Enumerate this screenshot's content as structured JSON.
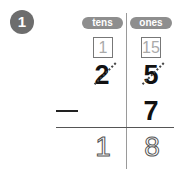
{
  "problem": {
    "number": "1",
    "columns": {
      "tens": "tens",
      "ones": "ones"
    },
    "regroup_boxes": {
      "tens": "1",
      "ones": "15"
    },
    "minuend": {
      "tens": "2",
      "ones": "5"
    },
    "operator": "−",
    "subtrahend": {
      "ones": "7"
    },
    "answer": {
      "tens": "1",
      "ones": "8"
    }
  }
}
